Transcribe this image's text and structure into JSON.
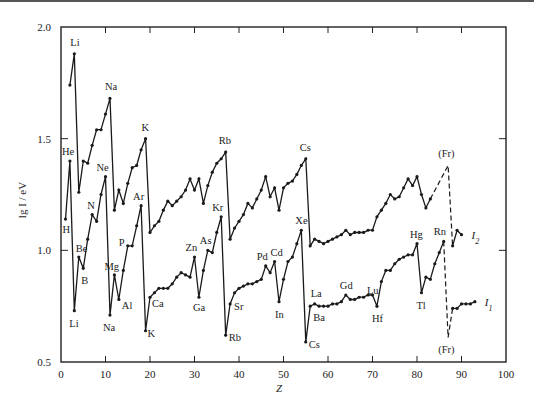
{
  "chart_data": {
    "type": "line",
    "title": "",
    "xlabel": "Z",
    "ylabel": "lg I / eV",
    "xlim": [
      0,
      100
    ],
    "ylim": [
      0.5,
      2.0
    ],
    "x_ticks": [
      0,
      10,
      20,
      30,
      40,
      50,
      60,
      70,
      80,
      90,
      100
    ],
    "y_ticks": [
      0.5,
      1.0,
      1.5,
      2.0
    ],
    "y_tick_labels": [
      "0.5",
      "1.0",
      "1.5",
      "2.0"
    ],
    "grid": false,
    "legend_position": "inline-right",
    "series": [
      {
        "name": "I1",
        "label": "I",
        "label_sub": "1",
        "points": [
          [
            1,
            1.14
          ],
          [
            2,
            1.4
          ],
          [
            3,
            0.73
          ],
          [
            4,
            0.97
          ],
          [
            5,
            0.92
          ],
          [
            6,
            1.05
          ],
          [
            7,
            1.16
          ],
          [
            8,
            1.13
          ],
          [
            9,
            1.25
          ],
          [
            10,
            1.33
          ],
          [
            11,
            0.71
          ],
          [
            12,
            0.89
          ],
          [
            13,
            0.78
          ],
          [
            14,
            0.91
          ],
          [
            15,
            1.02
          ],
          [
            16,
            1.02
          ],
          [
            17,
            1.11
          ],
          [
            18,
            1.2
          ],
          [
            19,
            0.64
          ],
          [
            20,
            0.79
          ],
          [
            21,
            0.81
          ],
          [
            22,
            0.83
          ],
          [
            23,
            0.83
          ],
          [
            24,
            0.83
          ],
          [
            25,
            0.85
          ],
          [
            26,
            0.88
          ],
          [
            27,
            0.9
          ],
          [
            28,
            0.89
          ],
          [
            29,
            0.88
          ],
          [
            30,
            0.97
          ],
          [
            31,
            0.79
          ],
          [
            32,
            0.91
          ],
          [
            33,
            1.0
          ],
          [
            34,
            0.99
          ],
          [
            35,
            1.08
          ],
          [
            36,
            1.15
          ],
          [
            37,
            0.62
          ],
          [
            38,
            0.76
          ],
          [
            39,
            0.81
          ],
          [
            40,
            0.83
          ],
          [
            41,
            0.84
          ],
          [
            42,
            0.85
          ],
          [
            43,
            0.85
          ],
          [
            44,
            0.86
          ],
          [
            45,
            0.87
          ],
          [
            46,
            0.93
          ],
          [
            47,
            0.9
          ],
          [
            48,
            0.95
          ],
          [
            49,
            0.77
          ],
          [
            50,
            0.87
          ],
          [
            51,
            0.95
          ],
          [
            52,
            0.97
          ],
          [
            53,
            1.03
          ],
          [
            54,
            1.09
          ],
          [
            55,
            0.59
          ],
          [
            56,
            0.75
          ],
          [
            57,
            0.76
          ],
          [
            58,
            0.75
          ],
          [
            59,
            0.75
          ],
          [
            60,
            0.75
          ],
          [
            61,
            0.76
          ],
          [
            62,
            0.76
          ],
          [
            63,
            0.77
          ],
          [
            64,
            0.8
          ],
          [
            65,
            0.78
          ],
          [
            66,
            0.78
          ],
          [
            67,
            0.79
          ],
          [
            68,
            0.79
          ],
          [
            69,
            0.8
          ],
          [
            70,
            0.8
          ],
          [
            71,
            0.75
          ],
          [
            72,
            0.86
          ],
          [
            73,
            0.91
          ],
          [
            74,
            0.91
          ],
          [
            75,
            0.94
          ],
          [
            76,
            0.96
          ],
          [
            77,
            0.97
          ],
          [
            78,
            0.98
          ],
          [
            79,
            0.98
          ],
          [
            80,
            1.03
          ],
          [
            81,
            0.81
          ],
          [
            82,
            0.88
          ],
          [
            83,
            0.87
          ],
          [
            84,
            0.94
          ],
          [
            85,
            0.99
          ],
          [
            86,
            1.04
          ]
        ],
        "dashed_points": [
          [
            86,
            1.04
          ],
          [
            87,
            0.61
          ],
          [
            88,
            0.74
          ]
        ],
        "tail_points": [
          [
            88,
            0.74
          ],
          [
            89,
            0.74
          ],
          [
            90,
            0.76
          ],
          [
            91,
            0.76
          ],
          [
            92,
            0.76
          ],
          [
            93,
            0.77
          ]
        ]
      },
      {
        "name": "I2",
        "label": "I",
        "label_sub": "2",
        "points": [
          [
            2,
            1.74
          ],
          [
            3,
            1.88
          ],
          [
            4,
            1.26
          ],
          [
            5,
            1.4
          ],
          [
            6,
            1.39
          ],
          [
            7,
            1.47
          ],
          [
            8,
            1.54
          ],
          [
            9,
            1.54
          ],
          [
            10,
            1.61
          ],
          [
            11,
            1.68
          ],
          [
            12,
            1.18
          ],
          [
            13,
            1.27
          ],
          [
            14,
            1.21
          ],
          [
            15,
            1.3
          ],
          [
            16,
            1.37
          ],
          [
            17,
            1.38
          ],
          [
            18,
            1.45
          ],
          [
            19,
            1.5
          ],
          [
            20,
            1.08
          ],
          [
            21,
            1.11
          ],
          [
            22,
            1.13
          ],
          [
            23,
            1.18
          ],
          [
            24,
            1.22
          ],
          [
            25,
            1.2
          ],
          [
            26,
            1.22
          ],
          [
            27,
            1.24
          ],
          [
            28,
            1.27
          ],
          [
            29,
            1.32
          ],
          [
            30,
            1.27
          ],
          [
            31,
            1.32
          ],
          [
            32,
            1.21
          ],
          [
            33,
            1.29
          ],
          [
            34,
            1.35
          ],
          [
            35,
            1.39
          ],
          [
            36,
            1.41
          ],
          [
            37,
            1.44
          ],
          [
            38,
            1.05
          ],
          [
            39,
            1.1
          ],
          [
            40,
            1.13
          ],
          [
            41,
            1.16
          ],
          [
            42,
            1.21
          ],
          [
            43,
            1.19
          ],
          [
            44,
            1.23
          ],
          [
            45,
            1.27
          ],
          [
            46,
            1.33
          ],
          [
            47,
            1.24
          ],
          [
            48,
            1.28
          ],
          [
            49,
            1.18
          ],
          [
            50,
            1.28
          ],
          [
            51,
            1.3
          ],
          [
            52,
            1.31
          ],
          [
            53,
            1.34
          ],
          [
            54,
            1.38
          ],
          [
            55,
            1.41
          ],
          [
            56,
            1.02
          ],
          [
            57,
            1.05
          ],
          [
            58,
            1.04
          ],
          [
            59,
            1.03
          ],
          [
            60,
            1.04
          ],
          [
            61,
            1.05
          ],
          [
            62,
            1.06
          ],
          [
            63,
            1.07
          ],
          [
            64,
            1.09
          ],
          [
            65,
            1.07
          ],
          [
            66,
            1.08
          ],
          [
            67,
            1.08
          ],
          [
            68,
            1.08
          ],
          [
            69,
            1.09
          ],
          [
            70,
            1.09
          ],
          [
            71,
            1.15
          ],
          [
            72,
            1.18
          ],
          [
            73,
            1.21
          ],
          [
            74,
            1.25
          ],
          [
            75,
            1.23
          ],
          [
            76,
            1.24
          ],
          [
            77,
            1.28
          ],
          [
            78,
            1.32
          ],
          [
            79,
            1.29
          ],
          [
            80,
            1.33
          ],
          [
            81,
            1.25
          ],
          [
            82,
            1.19
          ],
          [
            83,
            1.23
          ]
        ],
        "dashed_points": [
          [
            83,
            1.23
          ],
          [
            87,
            1.38
          ],
          [
            88,
            1.02
          ]
        ],
        "tail_points": [
          [
            88,
            1.02
          ],
          [
            89,
            1.09
          ],
          [
            90,
            1.07
          ]
        ]
      }
    ],
    "annotations": [
      {
        "text": "Li",
        "z": 3,
        "y": 1.88,
        "dx": -4,
        "dy": -8
      },
      {
        "text": "Na",
        "z": 11,
        "y": 1.68,
        "dx": -5,
        "dy": -8
      },
      {
        "text": "K",
        "z": 19,
        "y": 1.5,
        "dx": -4,
        "dy": -8
      },
      {
        "text": "Rb",
        "z": 37,
        "y": 1.44,
        "dx": -7,
        "dy": -8
      },
      {
        "text": "Cs",
        "z": 55,
        "y": 1.41,
        "dx": -6,
        "dy": -8
      },
      {
        "text": "(Fr)",
        "z": 87,
        "y": 1.38,
        "dx": -10,
        "dy": -8
      },
      {
        "text": "He",
        "z": 2,
        "y": 1.4,
        "dx": -8,
        "dy": -6
      },
      {
        "text": "H",
        "z": 1,
        "y": 1.14,
        "dx": -3,
        "dy": 14
      },
      {
        "text": "Ne",
        "z": 10,
        "y": 1.33,
        "dx": -9,
        "dy": -6
      },
      {
        "text": "N",
        "z": 7,
        "y": 1.16,
        "dx": -5,
        "dy": -6
      },
      {
        "text": "Be",
        "z": 4,
        "y": 0.97,
        "dx": -3,
        "dy": -5
      },
      {
        "text": "B",
        "z": 5,
        "y": 0.92,
        "dx": -2,
        "dy": 16
      },
      {
        "text": "Li",
        "z": 3,
        "y": 0.73,
        "dx": -5,
        "dy": 16
      },
      {
        "text": "Mg",
        "z": 12,
        "y": 0.89,
        "dx": -10,
        "dy": -5
      },
      {
        "text": "Na",
        "z": 11,
        "y": 0.71,
        "dx": -7,
        "dy": 16
      },
      {
        "text": "Al",
        "z": 13,
        "y": 0.78,
        "dx": 3,
        "dy": 10
      },
      {
        "text": "P",
        "z": 15,
        "y": 1.02,
        "dx": -9,
        "dy": 0
      },
      {
        "text": "Ar",
        "z": 18,
        "y": 1.2,
        "dx": -8,
        "dy": -6
      },
      {
        "text": "K",
        "z": 19,
        "y": 0.64,
        "dx": 2,
        "dy": 6
      },
      {
        "text": "Ca",
        "z": 20,
        "y": 0.79,
        "dx": 2,
        "dy": 10
      },
      {
        "text": "Zn",
        "z": 30,
        "y": 0.97,
        "dx": -9,
        "dy": -6
      },
      {
        "text": "As",
        "z": 33,
        "y": 1.0,
        "dx": -8,
        "dy": -6
      },
      {
        "text": "Ga",
        "z": 31,
        "y": 0.79,
        "dx": -6,
        "dy": 14
      },
      {
        "text": "Kr",
        "z": 36,
        "y": 1.15,
        "dx": -9,
        "dy": -6
      },
      {
        "text": "Sr",
        "z": 38,
        "y": 0.76,
        "dx": 4,
        "dy": 6
      },
      {
        "text": "Rb",
        "z": 37,
        "y": 0.62,
        "dx": 3,
        "dy": 6
      },
      {
        "text": "Pd",
        "z": 46,
        "y": 0.93,
        "dx": -9,
        "dy": -6
      },
      {
        "text": "Cd",
        "z": 48,
        "y": 0.95,
        "dx": -4,
        "dy": -6
      },
      {
        "text": "In",
        "z": 49,
        "y": 0.77,
        "dx": -4,
        "dy": 16
      },
      {
        "text": "Xe",
        "z": 54,
        "y": 1.09,
        "dx": -6,
        "dy": -6
      },
      {
        "text": "La",
        "z": 57,
        "y": 0.76,
        "dx": -4,
        "dy": -7
      },
      {
        "text": "Ba",
        "z": 56,
        "y": 0.75,
        "dx": 3,
        "dy": 15
      },
      {
        "text": "Cs",
        "z": 55,
        "y": 0.59,
        "dx": 3,
        "dy": 6
      },
      {
        "text": "Gd",
        "z": 64,
        "y": 0.8,
        "dx": -6,
        "dy": -6
      },
      {
        "text": "Lu",
        "z": 71,
        "y": 0.75,
        "dx": -10,
        "dy": -12
      },
      {
        "text": "Hf",
        "z": 71,
        "y": 0.75,
        "dx": -5,
        "dy": 16
      },
      {
        "text": "Hg",
        "z": 80,
        "y": 1.03,
        "dx": -7,
        "dy": -6
      },
      {
        "text": "Tl",
        "z": 81,
        "y": 0.81,
        "dx": -5,
        "dy": 16
      },
      {
        "text": "Rn",
        "z": 86,
        "y": 1.04,
        "dx": -10,
        "dy": -6
      },
      {
        "text": "(Fr)",
        "z": 87,
        "y": 0.61,
        "dx": -10,
        "dy": 16
      }
    ]
  },
  "colors": {
    "line": "#1a1a1a",
    "axis": "#222222",
    "background": "#ffffff"
  }
}
